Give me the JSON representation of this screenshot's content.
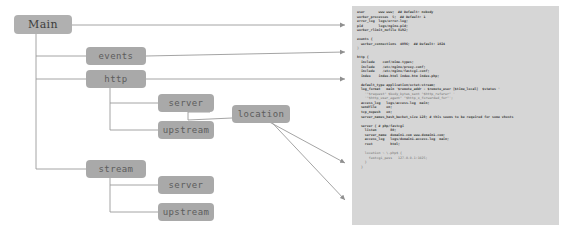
{
  "diagram": {
    "node_fill": "#a9a9a9",
    "line_color": "#9a9a9a",
    "nodes": [
      {
        "id": "main",
        "label": "Main"
      },
      {
        "id": "events",
        "label": "events"
      },
      {
        "id": "http",
        "label": "http"
      },
      {
        "id": "http-server",
        "label": "server"
      },
      {
        "id": "upstream",
        "label": "upstream"
      },
      {
        "id": "location",
        "label": "location"
      },
      {
        "id": "stream",
        "label": "stream"
      },
      {
        "id": "stream-server",
        "label": "server"
      },
      {
        "id": "stream-upstream",
        "label": "upstream"
      }
    ]
  },
  "code_panel": {
    "background": "#d6d6d6",
    "lines": [
      {
        "text": "user       www www;  ## Default: nobody",
        "bold": true
      },
      {
        "text": "worker_processes  5;  ## Default: 1",
        "bold": true
      },
      {
        "text": "error_log  logs/error.log;",
        "bold": true
      },
      {
        "text": "pid        logs/nginx.pid;",
        "bold": true
      },
      {
        "text": "worker_rlimit_nofile 8192;",
        "bold": true
      },
      {
        "text": "",
        "bold": false
      },
      {
        "text": "events {",
        "bold": true
      },
      {
        "text": "  worker_connections  4096;  ## Default: 1024",
        "bold": true
      },
      {
        "text": "}",
        "bold": false
      },
      {
        "text": "",
        "bold": false
      },
      {
        "text": "http {",
        "bold": true
      },
      {
        "text": "  include    conf/mime.types;",
        "bold": true
      },
      {
        "text": "  include    /etc/nginx/proxy.conf;",
        "bold": true
      },
      {
        "text": "  include    /etc/nginx/fastcgi.conf;",
        "bold": true
      },
      {
        "text": "  index    index.html index.htm index.php;",
        "bold": true
      },
      {
        "text": "",
        "bold": false
      },
      {
        "text": "  default_type application/octet-stream;",
        "bold": true
      },
      {
        "text": "  log_format   main '$remote_addr - $remote_user [$time_local]  $status '",
        "bold": true
      },
      {
        "text": "    '\"$request\" $body_bytes_sent \"$http_referer\" '",
        "bold": false
      },
      {
        "text": "    '\"$http_user_agent\" \"$http_x_forwarded_for\"';",
        "bold": false
      },
      {
        "text": "  access_log   logs/access.log  main;",
        "bold": true
      },
      {
        "text": "  sendfile     on;",
        "bold": true
      },
      {
        "text": "  tcp_nopush   on;",
        "bold": true
      },
      {
        "text": "  server_names_hash_bucket_size 128; # this seems to be required for some vhosts",
        "bold": true
      },
      {
        "text": "",
        "bold": false
      },
      {
        "text": "  server { # php/fastcgi",
        "bold": true
      },
      {
        "text": "    listen       80;",
        "bold": true
      },
      {
        "text": "    server_name  domain1.com www.domain1.com;",
        "bold": true
      },
      {
        "text": "    access_log   logs/domain1.access.log  main;",
        "bold": true
      },
      {
        "text": "    root         html;",
        "bold": true
      },
      {
        "text": "",
        "bold": false
      },
      {
        "text": "    location ~ \\.php$ {",
        "bold": false
      },
      {
        "text": "      fastcgi_pass   127.0.0.1:1025;",
        "bold": false
      },
      {
        "text": "    }",
        "bold": false
      },
      {
        "text": "  }",
        "bold": false
      }
    ]
  }
}
